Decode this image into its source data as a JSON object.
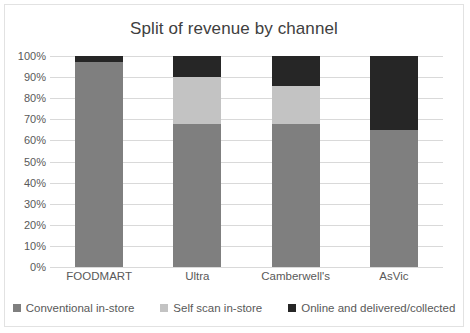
{
  "chart_data": {
    "type": "bar",
    "subtype": "stacked-100-percent",
    "title": "Split of revenue by channel",
    "xlabel": "",
    "ylabel": "",
    "ylim": [
      0,
      100
    ],
    "ytick_labels": [
      "100%",
      "90%",
      "80%",
      "70%",
      "60%",
      "50%",
      "40%",
      "30%",
      "20%",
      "10%",
      "0%"
    ],
    "ytick_values": [
      100,
      90,
      80,
      70,
      60,
      50,
      40,
      30,
      20,
      10,
      0
    ],
    "grid": true,
    "legend_position": "bottom",
    "categories": [
      "FOODMART",
      "Ultra",
      "Camberwell's",
      "AsVic"
    ],
    "series": [
      {
        "name": "Conventional in-store",
        "color": "#7f7f7f",
        "values": [
          97,
          68,
          68,
          65
        ]
      },
      {
        "name": "Self scan in-store",
        "color": "#c3c3c3",
        "values": [
          0,
          22,
          18,
          0
        ]
      },
      {
        "name": "Online and delivered/collected",
        "color": "#262626",
        "values": [
          3,
          10,
          14,
          35
        ]
      }
    ]
  },
  "colors": {
    "title_text": "#404040",
    "axis_text": "#595959",
    "gridline": "#d9d9d9",
    "frame_border": "#e2e2e2",
    "background": "#ffffff"
  }
}
